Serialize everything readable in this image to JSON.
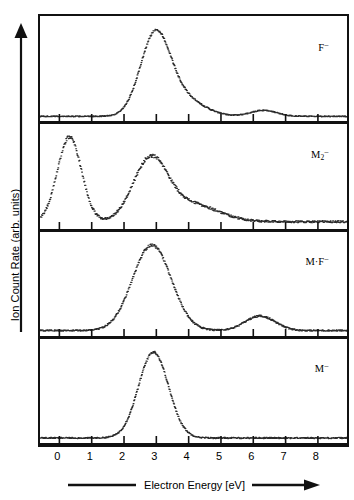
{
  "figure": {
    "y_axis": {
      "label": "Ion Count Rate (arb. units)",
      "arrow": "up-arrow-icon"
    },
    "x_axis": {
      "label": "Electron Energy [eV]",
      "arrow": "right-arrow-icon"
    }
  },
  "chart_data": {
    "type": "line",
    "title": "",
    "xlabel": "Electron Energy [eV]",
    "ylabel": "Ion Count Rate (arb. units)",
    "xlim": [
      -0.6,
      8.9
    ],
    "ylim": [
      0,
      1.05
    ],
    "grid": false,
    "legend": "none",
    "xticks": [
      0,
      1,
      2,
      3,
      4,
      5,
      6,
      7,
      8
    ],
    "xticklabels": [
      "0",
      "1",
      "2",
      "3",
      "4",
      "5",
      "6",
      "7",
      "8"
    ],
    "yticks": [],
    "panels": [
      {
        "id": "panel-f-minus",
        "label_html": "F<sup>−</sup>",
        "label_text": "F−",
        "peaks": [
          {
            "center": 2.95,
            "height": 1.0,
            "width": 0.62,
            "note": "main resonance"
          },
          {
            "center": 6.3,
            "height": 0.075,
            "width": 0.55,
            "note": "weak high-energy shoulder"
          }
        ],
        "shoulders": [
          {
            "center": 3.8,
            "height": 0.22,
            "width": 0.85
          }
        ],
        "baseline": 0.012,
        "noise": 0.012
      },
      {
        "id": "panel-m2-minus",
        "label_html": "M<sub>2</sub><sup>−</sup>",
        "label_text": "M2−",
        "peaks": [
          {
            "center": 0.3,
            "height": 1.0,
            "width": 0.5,
            "note": "low-energy peak"
          },
          {
            "center": 2.8,
            "height": 0.72,
            "width": 0.72,
            "note": "second peak"
          }
        ],
        "shoulders": [
          {
            "center": 4.1,
            "height": 0.2,
            "width": 1.1
          }
        ],
        "baseline": 0.03,
        "noise": 0.022
      },
      {
        "id": "panel-mf-minus",
        "label_html": "M·F<sup>−</sup>",
        "label_text": "M·F−",
        "peaks": [
          {
            "center": 2.85,
            "height": 1.0,
            "width": 0.8,
            "note": "broad main resonance"
          },
          {
            "center": 6.2,
            "height": 0.17,
            "width": 0.62,
            "note": "secondary resonance"
          }
        ],
        "shoulders": [],
        "baseline": 0.02,
        "noise": 0.016
      },
      {
        "id": "panel-m-minus",
        "label_html": "M<sup>−</sup>",
        "label_text": "M−",
        "peaks": [
          {
            "center": 2.9,
            "height": 1.0,
            "width": 0.62,
            "note": "single resonance"
          }
        ],
        "shoulders": [],
        "baseline": 0.015,
        "noise": 0.014
      }
    ]
  },
  "colors": {
    "ink": "#111111",
    "trace": "#2b2b2b",
    "background": "#ffffff"
  }
}
